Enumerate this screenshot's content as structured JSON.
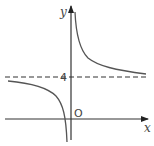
{
  "diagram": {
    "type": "function-graph",
    "axes": {
      "x_label": "x",
      "y_label": "y",
      "origin_label": "O"
    },
    "asymptotes": {
      "horizontal": {
        "value": 4,
        "label": "4",
        "style": "dashed"
      },
      "vertical": {
        "position": "slightly left of y-axis",
        "style": "implicit"
      }
    },
    "curves": [
      {
        "name": "left-branch",
        "description": "approaches y=4 from below as x→-∞, descends to -∞ near vertical asymptote, crossing the x-axis just left of origin"
      },
      {
        "name": "right-branch",
        "description": "descends from +∞ near y-axis, approaches y=4 from above as x→+∞"
      }
    ],
    "colors": {
      "axis": "#333333",
      "curve": "#555555",
      "dashed": "#333333"
    }
  }
}
